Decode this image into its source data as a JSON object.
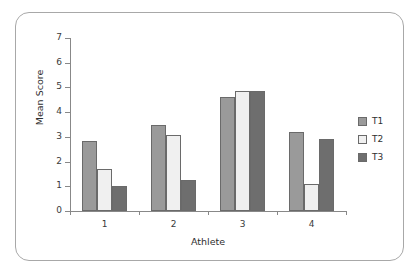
{
  "chart_data": {
    "type": "bar",
    "title": "",
    "subtitle": "",
    "xlabel": "Athlete",
    "ylabel": "Mean Score",
    "categories": [
      "1",
      "2",
      "3",
      "4"
    ],
    "series": [
      {
        "name": "T1",
        "values": [
          2.85,
          3.5,
          4.6,
          3.18
        ],
        "color": "#9a9a9a"
      },
      {
        "name": "T2",
        "values": [
          1.68,
          3.08,
          4.85,
          1.1
        ],
        "color": "#f0f0f0"
      },
      {
        "name": "T3",
        "values": [
          1.02,
          1.25,
          4.85,
          2.93
        ],
        "color": "#6e6e6e"
      }
    ],
    "ylim": [
      0,
      7
    ],
    "yticks": [
      "0",
      "1",
      "2",
      "3",
      "4",
      "5",
      "6",
      "7"
    ],
    "grid": false,
    "legend_position": "right",
    "legend_entries": [
      "T1",
      "T2",
      "T3"
    ],
    "axis_color": "#888888",
    "text_color": "#2f2f2f",
    "background": "#ffffff",
    "frame_color": "#a8a8a8"
  }
}
